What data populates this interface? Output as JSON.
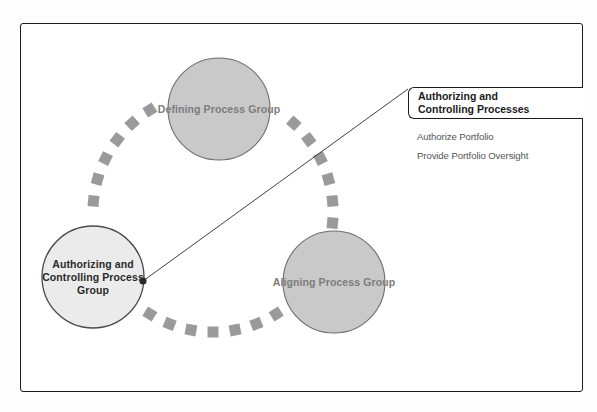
{
  "diagram": {
    "type": "process-group-cycle",
    "title_of_highlight": "Authorizing and Controlling Processes",
    "ring": {
      "center_x": 213,
      "center_y": 212,
      "radius": 120,
      "dash_color": "#9a9a9a",
      "dash_size": 11,
      "dash_count": 34
    },
    "nodes": [
      {
        "id": "defining",
        "label": "Defining\nProcess\nGroup",
        "cx": 219,
        "cy": 109,
        "r": 51,
        "fill": "#c9c9c9",
        "stroke": "#6e6e6e",
        "text_color": "#7c7c7c",
        "highlighted": false
      },
      {
        "id": "authorizing-controlling",
        "label": "Authorizing and\nControlling\nProcess Group",
        "cx": 93,
        "cy": 277,
        "r": 51,
        "fill": "#ebebeb",
        "stroke": "#4a4a4a",
        "text_color": "#2a2a2a",
        "highlighted": true
      },
      {
        "id": "aligning",
        "label": "Aligning\nProcess\nGroup",
        "cx": 334,
        "cy": 282,
        "r": 51,
        "fill": "#c9c9c9",
        "stroke": "#6e6e6e",
        "text_color": "#7c7c7c",
        "highlighted": false
      }
    ],
    "leader": {
      "from_x": 143,
      "from_y": 281,
      "to_x": 408,
      "to_y": 89,
      "dot_radius": 3.6,
      "color": "#2b2b2b"
    }
  },
  "callout": {
    "title": "Authorizing and\nControlling Processes",
    "items": [
      "Authorize Portfolio",
      "Provide Portfolio Oversight"
    ]
  },
  "colors": {
    "frame": "#1b1b1b",
    "circle_fill": "#c9c9c9",
    "circle_fill_highlight": "#ebebeb",
    "dash": "#9a9a9a",
    "label_muted": "#7c7c7c",
    "label_strong": "#2a2a2a",
    "page_background": "#ffffff"
  }
}
